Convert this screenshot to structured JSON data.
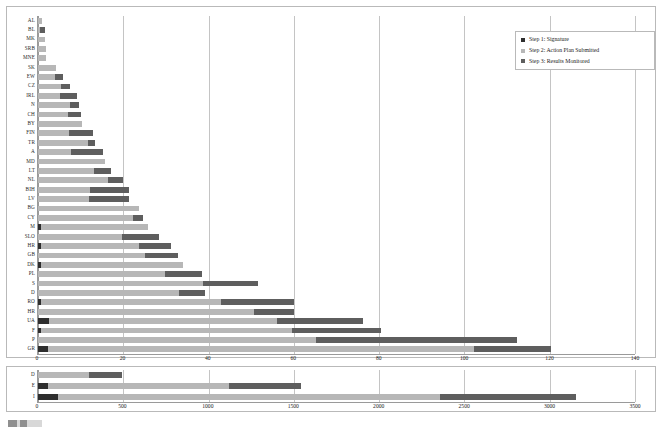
{
  "chart_data": [
    {
      "id": "main",
      "type": "bar",
      "orientation": "horizontal",
      "stacked": true,
      "title": "",
      "xlabel": "",
      "ylabel": "",
      "xlim": [
        0,
        140
      ],
      "xticks": [
        0,
        20,
        40,
        60,
        80,
        100,
        120,
        140
      ],
      "grid": "vertical",
      "legend_position": "top-right",
      "series": [
        {
          "name": "Step 1: Signature",
          "color": "#2e2e2e"
        },
        {
          "name": "Step 2: Action Plan Submitted",
          "color": "#b7b7b7"
        },
        {
          "name": "Step 3: Results Monitored",
          "color": "#5e5e5e"
        }
      ],
      "categories": [
        "AL",
        "BL",
        "MK",
        "SRB",
        "MNE",
        "SK",
        "EW",
        "CZ",
        "IRL",
        "N",
        "CH",
        "BY",
        "FIN",
        "TR",
        "A",
        "MD",
        "LT",
        "NL",
        "BIH",
        "LV",
        "BG",
        "CY",
        "M",
        "SLO",
        "HR",
        "GB",
        "DK",
        "PL",
        "S",
        "D",
        "RO",
        "HR",
        "UA",
        "F",
        "P",
        "GR"
      ],
      "rows": [
        {
          "label": "AL",
          "step1": 0.0,
          "step2": 1.0,
          "step3": 0.0
        },
        {
          "label": "BL",
          "step1": 0.0,
          "step2": 0.4,
          "step3": 1.2
        },
        {
          "label": "MK",
          "step1": 0.0,
          "step2": 1.6,
          "step3": 0.0
        },
        {
          "label": "SRB",
          "step1": 0.0,
          "step2": 1.8,
          "step3": 0.0
        },
        {
          "label": "MNE",
          "step1": 0.0,
          "step2": 1.9,
          "step3": 0.0
        },
        {
          "label": "SK",
          "step1": 0.0,
          "step2": 4.2,
          "step3": 0.0
        },
        {
          "label": "EW",
          "step1": 0.0,
          "step2": 4.0,
          "step3": 1.9
        },
        {
          "label": "CZ",
          "step1": 0.0,
          "step2": 5.5,
          "step3": 1.9
        },
        {
          "label": "IRL",
          "step1": 0.0,
          "step2": 5.2,
          "step3": 4.0
        },
        {
          "label": "N",
          "step1": 0.0,
          "step2": 7.4,
          "step3": 2.1
        },
        {
          "label": "CH",
          "step1": 0.0,
          "step2": 7.0,
          "step3": 3.1
        },
        {
          "label": "BY",
          "step1": 0.0,
          "step2": 10.4,
          "step3": 0.0
        },
        {
          "label": "FIN",
          "step1": 0.0,
          "step2": 7.3,
          "step3": 5.6
        },
        {
          "label": "TR",
          "step1": 0.0,
          "step2": 11.8,
          "step3": 1.5
        },
        {
          "label": "A",
          "step1": 0.0,
          "step2": 7.8,
          "step3": 7.4
        },
        {
          "label": "MD",
          "step1": 0.0,
          "step2": 15.6,
          "step3": 0.0
        },
        {
          "label": "LT",
          "step1": 0.0,
          "step2": 13.2,
          "step3": 4.0
        },
        {
          "label": "NL",
          "step1": 0.0,
          "step2": 16.3,
          "step3": 3.6
        },
        {
          "label": "BIH",
          "step1": 0.0,
          "step2": 12.3,
          "step3": 9.0
        },
        {
          "label": "LV",
          "step1": 0.0,
          "step2": 11.9,
          "step3": 9.4
        },
        {
          "label": "BG",
          "step1": 0.0,
          "step2": 23.8,
          "step3": 0.0
        },
        {
          "label": "CY",
          "step1": 0.0,
          "step2": 22.3,
          "step3": 2.4
        },
        {
          "label": "M",
          "step1": 0.6,
          "step2": 25.2,
          "step3": 0.0
        },
        {
          "label": "SLO",
          "step1": 0.0,
          "step2": 19.8,
          "step3": 8.6
        },
        {
          "label": "HR",
          "step1": 0.7,
          "step2": 23.1,
          "step3": 7.3
        },
        {
          "label": "GB",
          "step1": 0.0,
          "step2": 25.1,
          "step3": 7.8
        },
        {
          "label": "DK",
          "step1": 0.7,
          "step2": 33.2,
          "step3": 0.0
        },
        {
          "label": "PL",
          "step1": 0.0,
          "step2": 29.7,
          "step3": 8.8
        },
        {
          "label": "S",
          "step1": 0.0,
          "step2": 38.6,
          "step3": 13.0
        },
        {
          "label": "D",
          "step1": 0.0,
          "step2": 33.0,
          "step3": 6.2
        },
        {
          "label": "RO",
          "step1": 0.7,
          "step2": 42.2,
          "step3": 17.1
        },
        {
          "label": "HR",
          "step1": 0.0,
          "step2": 50.6,
          "step3": 9.5
        },
        {
          "label": "UA",
          "step1": 2.5,
          "step2": 53.6,
          "step3": 20.0
        },
        {
          "label": "F",
          "step1": 0.6,
          "step2": 58.9,
          "step3": 20.9
        },
        {
          "label": "P",
          "step1": 0.0,
          "step2": 65.1,
          "step3": 47.2
        },
        {
          "label": "GR",
          "step1": 2.4,
          "step2": 99.8,
          "step3": 18.1
        }
      ]
    },
    {
      "id": "overflow",
      "type": "bar",
      "orientation": "horizontal",
      "stacked": true,
      "title": "",
      "xlabel": "",
      "ylabel": "",
      "xlim": [
        0,
        3500
      ],
      "xticks": [
        0,
        500,
        1000,
        1500,
        2000,
        2500,
        3000,
        3500
      ],
      "grid": "vertical",
      "series": [
        {
          "name": "Step 1: Signature",
          "color": "#2e2e2e"
        },
        {
          "name": "Step 2: Action Plan Submitted",
          "color": "#b7b7b7"
        },
        {
          "name": "Step 3: Results Monitored",
          "color": "#5e5e5e"
        }
      ],
      "categories": [
        "D",
        "E",
        "I"
      ],
      "rows": [
        {
          "label": "D",
          "step1": 0,
          "step2": 300,
          "step3": 190
        },
        {
          "label": "E",
          "step1": 60,
          "step2": 1060,
          "step3": 420
        },
        {
          "label": "I",
          "step1": 115,
          "step2": 2240,
          "step3": 800
        }
      ]
    }
  ],
  "legend": {
    "items": [
      {
        "label": "Step 1: Signature",
        "color": "#2e2e2e",
        "swatch_icon": "square-swatch-icon"
      },
      {
        "label": "Step 2: Action Plan Submitted",
        "color": "#b7b7b7",
        "swatch_icon": "square-swatch-icon"
      },
      {
        "label": "Step 3: Results Monitored",
        "color": "#5e5e5e",
        "swatch_icon": "square-swatch-icon"
      }
    ]
  },
  "colors": {
    "step1": "#2e2e2e",
    "step2": "#b7b7b7",
    "step3": "#5e5e5e",
    "gridline": "#c4c4c4",
    "axis": "#9a9a9a",
    "frame": "#b9b9b9",
    "background": "#ffffff"
  }
}
